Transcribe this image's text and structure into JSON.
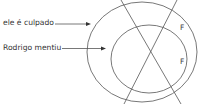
{
  "diagram": {
    "labels": [
      {
        "text": "ele é culpado",
        "points_to": "outer-circle"
      },
      {
        "text": "Rodrigo mentiu",
        "points_to": "inner-circle"
      }
    ],
    "region_marks": [
      "F",
      "F"
    ],
    "colors": {
      "stroke": "#555555",
      "text": "#333333",
      "background": "#ffffff"
    }
  }
}
